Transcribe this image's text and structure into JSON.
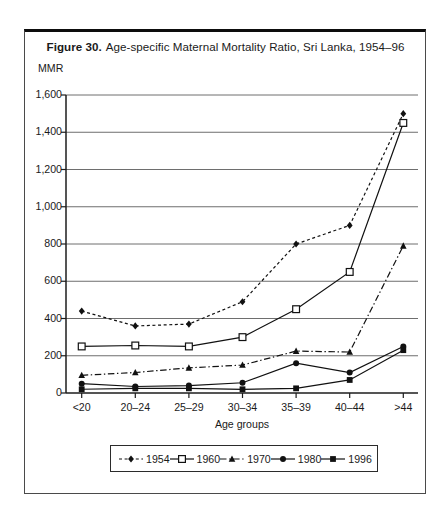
{
  "figure": {
    "title_prefix": "Figure 30.",
    "title_rest": "Age-specific Maternal Mortality Ratio, Sri Lanka, 1954–96"
  },
  "chart_data": {
    "type": "line",
    "xlabel": "Age groups",
    "ylabel": "MMR",
    "ylim": [
      0,
      1600
    ],
    "ytick_step": 200,
    "ytick_labels": [
      "0",
      "200",
      "400",
      "600",
      "800",
      "1,000",
      "1,200",
      "1,400",
      "1,600"
    ],
    "categories": [
      "<20",
      "20–24",
      "25–29",
      "30–34",
      "35–39",
      "40–44",
      ">44"
    ],
    "grid": true,
    "legend_position": "bottom",
    "series": [
      {
        "name": "1954",
        "marker": "diamond-filled",
        "line": "dashed",
        "color": "#111111",
        "values": [
          440,
          360,
          370,
          490,
          800,
          900,
          1500
        ]
      },
      {
        "name": "1960",
        "marker": "square-open",
        "line": "solid",
        "color": "#111111",
        "values": [
          250,
          255,
          250,
          300,
          450,
          650,
          1450
        ]
      },
      {
        "name": "1970",
        "marker": "triangle-filled",
        "line": "dashdot",
        "color": "#111111",
        "values": [
          95,
          110,
          135,
          150,
          225,
          220,
          790
        ]
      },
      {
        "name": "1980",
        "marker": "circle-filled",
        "line": "solid",
        "color": "#111111",
        "values": [
          50,
          35,
          40,
          55,
          160,
          110,
          250
        ]
      },
      {
        "name": "1996",
        "marker": "square-filled",
        "line": "solid",
        "color": "#111111",
        "values": [
          20,
          25,
          25,
          20,
          25,
          70,
          230
        ]
      }
    ]
  },
  "colors": {
    "background": "#ffffff",
    "frame_border": "#4a4a4a",
    "frame_border_top": "#0d0d0d",
    "grid": "#6e6e6e",
    "axis": "#1c1c1c",
    "text": "#1a1a1a"
  }
}
